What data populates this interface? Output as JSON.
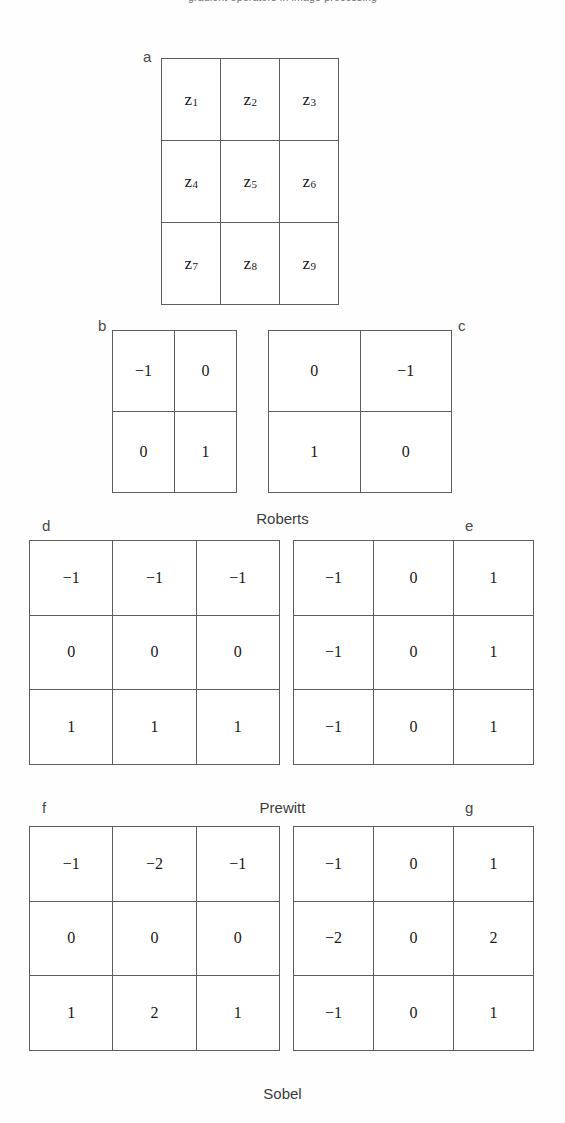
{
  "figure": {
    "top_caption": "gradient operators in image processing",
    "background_color": "#ffffff",
    "line_color": "#5d5d5d",
    "text_color": "#181818"
  },
  "panels": {
    "a": {
      "letter": "a",
      "role": "image-neighborhood"
    },
    "b": {
      "letter": "b",
      "role": "roberts-gx"
    },
    "c": {
      "letter": "c",
      "role": "roberts-gy"
    },
    "d": {
      "letter": "d",
      "role": "prewitt-gx"
    },
    "e": {
      "letter": "e",
      "role": "prewitt-gy"
    },
    "f": {
      "letter": "f",
      "role": "sobel-gx"
    },
    "g": {
      "letter": "g",
      "role": "sobel-gy"
    }
  },
  "captions": {
    "roberts": "Roberts",
    "prewitt": "Prewitt",
    "sobel": "Sobel"
  },
  "neighborhood": {
    "symbol": "z",
    "cells": [
      {
        "base": "z",
        "sub": "1"
      },
      {
        "base": "z",
        "sub": "2"
      },
      {
        "base": "z",
        "sub": "3"
      },
      {
        "base": "z",
        "sub": "4"
      },
      {
        "base": "z",
        "sub": "5"
      },
      {
        "base": "z",
        "sub": "6"
      },
      {
        "base": "z",
        "sub": "7"
      },
      {
        "base": "z",
        "sub": "8"
      },
      {
        "base": "z",
        "sub": "9"
      }
    ]
  },
  "masks": {
    "roberts_gx": {
      "size": "2x2",
      "values": [
        "−1",
        "0",
        "0",
        "1"
      ]
    },
    "roberts_gy": {
      "size": "2x2",
      "values": [
        "0",
        "−1",
        "1",
        "0"
      ]
    },
    "prewitt_gx": {
      "size": "3x3",
      "values": [
        "−1",
        "−1",
        "−1",
        "0",
        "0",
        "0",
        "1",
        "1",
        "1"
      ]
    },
    "prewitt_gy": {
      "size": "3x3",
      "values": [
        "−1",
        "0",
        "1",
        "−1",
        "0",
        "1",
        "−1",
        "0",
        "1"
      ]
    },
    "sobel_gx": {
      "size": "3x3",
      "values": [
        "−1",
        "−2",
        "−1",
        "0",
        "0",
        "0",
        "1",
        "2",
        "1"
      ]
    },
    "sobel_gy": {
      "size": "3x3",
      "values": [
        "−1",
        "0",
        "1",
        "−2",
        "0",
        "2",
        "−1",
        "0",
        "1"
      ]
    }
  },
  "chart_data": {
    "type": "table",
    "tables": [
      {
        "id": "a",
        "label": "a",
        "caption": "",
        "rows": 3,
        "cols": 3,
        "values": [
          [
            "z1",
            "z2",
            "z3"
          ],
          [
            "z4",
            "z5",
            "z6"
          ],
          [
            "z7",
            "z8",
            "z9"
          ]
        ]
      },
      {
        "id": "b",
        "label": "b",
        "caption": "Roberts",
        "rows": 2,
        "cols": 2,
        "values": [
          [
            "-1",
            "0"
          ],
          [
            "0",
            "1"
          ]
        ]
      },
      {
        "id": "c",
        "label": "c",
        "caption": "Roberts",
        "rows": 2,
        "cols": 2,
        "values": [
          [
            "0",
            "-1"
          ],
          [
            "1",
            "0"
          ]
        ]
      },
      {
        "id": "d",
        "label": "d",
        "caption": "Prewitt",
        "rows": 3,
        "cols": 3,
        "values": [
          [
            "-1",
            "-1",
            "-1"
          ],
          [
            "0",
            "0",
            "0"
          ],
          [
            "1",
            "1",
            "1"
          ]
        ]
      },
      {
        "id": "e",
        "label": "e",
        "caption": "Prewitt",
        "rows": 3,
        "cols": 3,
        "values": [
          [
            "-1",
            "0",
            "1"
          ],
          [
            "-1",
            "0",
            "1"
          ],
          [
            "-1",
            "0",
            "1"
          ]
        ]
      },
      {
        "id": "f",
        "label": "f",
        "caption": "Sobel",
        "rows": 3,
        "cols": 3,
        "values": [
          [
            "-1",
            "-2",
            "-1"
          ],
          [
            "0",
            "0",
            "0"
          ],
          [
            "1",
            "2",
            "1"
          ]
        ]
      },
      {
        "id": "g",
        "label": "g",
        "caption": "Sobel",
        "rows": 3,
        "cols": 3,
        "values": [
          [
            "-1",
            "0",
            "1"
          ],
          [
            "-2",
            "0",
            "2"
          ],
          [
            "-1",
            "0",
            "1"
          ]
        ]
      }
    ]
  }
}
